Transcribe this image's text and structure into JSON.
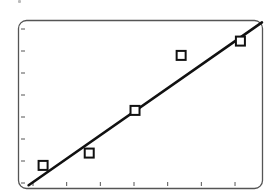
{
  "chart_data": {
    "type": "scatter",
    "title": "",
    "xlabel": "",
    "ylabel": "",
    "x_ticks": [
      1,
      2,
      3,
      4,
      5,
      6,
      7
    ],
    "y_ticks": [
      0,
      1,
      2,
      3,
      4,
      5,
      6,
      7
    ],
    "tick_labels_visible": false,
    "xlim": [
      0.72,
      7.7
    ],
    "ylim": [
      -0.1,
      7.4
    ],
    "grid": false,
    "legend": null,
    "series": [
      {
        "name": "observations",
        "marker": "open-square",
        "x": [
          1.3,
          2.67,
          4.03,
          5.4,
          7.16
        ],
        "y": [
          0.8,
          1.36,
          3.3,
          5.8,
          6.45
        ]
      },
      {
        "name": "fit-line",
        "style": "line",
        "x": [
          0.87,
          7.8
        ],
        "y": [
          -0.1,
          7.3
        ]
      }
    ]
  },
  "colors": {
    "frame": "#555555",
    "ink": "#111111",
    "background": "#ffffff"
  }
}
